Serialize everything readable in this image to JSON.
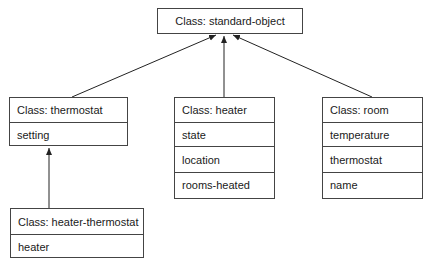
{
  "diagram": {
    "type": "class-hierarchy",
    "classes": [
      {
        "id": "standard-object",
        "title": "Class: standard-object",
        "slots": []
      },
      {
        "id": "thermostat",
        "title": "Class: thermostat",
        "slots": [
          "setting"
        ]
      },
      {
        "id": "heater",
        "title": "Class: heater",
        "slots": [
          "state",
          "location",
          "rooms-heated"
        ]
      },
      {
        "id": "room",
        "title": "Class: room",
        "slots": [
          "temperature",
          "thermostat",
          "name"
        ]
      },
      {
        "id": "heater-thermostat",
        "title": "Class: heater-thermostat",
        "slots": [
          "heater"
        ]
      }
    ],
    "edges": [
      {
        "from": "thermostat",
        "to": "standard-object"
      },
      {
        "from": "heater",
        "to": "standard-object"
      },
      {
        "from": "room",
        "to": "standard-object"
      },
      {
        "from": "heater-thermostat",
        "to": "thermostat"
      }
    ]
  }
}
